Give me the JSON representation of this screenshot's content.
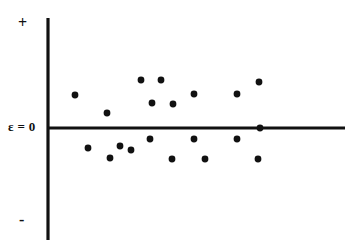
{
  "figure": {
    "background_color": "#ffffff",
    "ink_color": "#111111",
    "width": 359,
    "height": 247
  },
  "labels": {
    "positive": "+",
    "negative": "-",
    "zero_line": "ε = 0"
  },
  "chart_data": {
    "type": "scatter",
    "title": "",
    "subtitle": "",
    "xlabel": "",
    "ylabel": "ε",
    "annotations": [
      {
        "text": "+",
        "position": "top-left-of-y-axis",
        "meaning": "positive residuals"
      },
      {
        "text": "-",
        "position": "bottom-left-of-y-axis",
        "meaning": "negative residuals"
      },
      {
        "text": "ε = 0",
        "position": "left-of-origin",
        "meaning": "zero residual reference line"
      }
    ],
    "grid": false,
    "legend": null,
    "axes": {
      "y_axis": {
        "x_px": 48,
        "y_top_px": 18,
        "y_bottom_px": 240,
        "visible": true,
        "ticks": []
      },
      "x_axis": {
        "y_px": 128,
        "x_left_px": 48,
        "x_right_px": 345,
        "visible": true,
        "ticks": []
      }
    },
    "xlim": [
      0,
      100
    ],
    "ylim": [
      -1,
      1
    ],
    "points_px": [
      {
        "x": 75,
        "y": 95
      },
      {
        "x": 107,
        "y": 113
      },
      {
        "x": 141,
        "y": 80
      },
      {
        "x": 161,
        "y": 80
      },
      {
        "x": 152,
        "y": 103
      },
      {
        "x": 173,
        "y": 104
      },
      {
        "x": 194,
        "y": 94
      },
      {
        "x": 237,
        "y": 94
      },
      {
        "x": 259,
        "y": 82
      },
      {
        "x": 260,
        "y": 128
      },
      {
        "x": 150,
        "y": 139
      },
      {
        "x": 194,
        "y": 139
      },
      {
        "x": 237,
        "y": 139
      },
      {
        "x": 88,
        "y": 148
      },
      {
        "x": 120,
        "y": 146
      },
      {
        "x": 110,
        "y": 158
      },
      {
        "x": 172,
        "y": 159
      },
      {
        "x": 205,
        "y": 159
      },
      {
        "x": 258,
        "y": 159
      },
      {
        "x": 131,
        "y": 150
      }
    ],
    "point_radius_px": 3.4,
    "n_points": 20
  }
}
